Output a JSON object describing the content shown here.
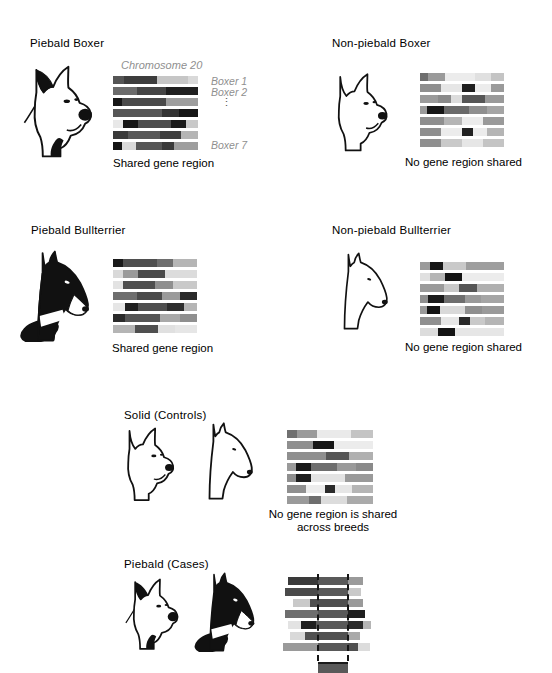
{
  "colors": {
    "background": "#ffffff",
    "text": "#000000",
    "muted_label": "#8f8f8f",
    "dashed_line": "#151515",
    "shared_segment": "#595959"
  },
  "panels": [
    {
      "id": "piebald-boxer",
      "title": "Piebald Boxer",
      "caption": "Shared gene region",
      "labels": {
        "chromosome": "Chromosome 20",
        "row_first": "Boxer 1",
        "row_second": "Boxer 2",
        "ellipsis": "⋮",
        "row_last": "Boxer 7"
      },
      "dog": "piebald-boxer-head",
      "bars": [
        [
          {
            "c": "#555555",
            "w": 13
          },
          {
            "c": "#3d3d3d",
            "w": 39
          },
          {
            "c": "#c6c6c6",
            "w": 36
          },
          {
            "c": "#d9d9d9",
            "w": 12
          }
        ],
        [
          {
            "c": "#6b6b6b",
            "w": 28
          },
          {
            "c": "#454545",
            "w": 34
          },
          {
            "c": "#1f1f1f",
            "w": 38
          }
        ],
        [
          {
            "c": "#161616",
            "w": 10
          },
          {
            "c": "#4a4a4a",
            "w": 52
          },
          {
            "c": "#9e9e9e",
            "w": 38
          }
        ],
        [
          {
            "c": "#575757",
            "w": 58
          },
          {
            "c": "#333333",
            "w": 20
          },
          {
            "c": "#161616",
            "w": 22
          }
        ],
        [
          {
            "c": "#e8e8e8",
            "w": 12
          },
          {
            "c": "#161616",
            "w": 18
          },
          {
            "c": "#4d4d4d",
            "w": 38
          },
          {
            "c": "#1a1a1a",
            "w": 18
          },
          {
            "c": "#c9c9c9",
            "w": 14
          }
        ],
        [
          {
            "c": "#3a3a3a",
            "w": 18
          },
          {
            "c": "#585858",
            "w": 37
          },
          {
            "c": "#3f3f3f",
            "w": 25
          },
          {
            "c": "#b5b5b5",
            "w": 20
          }
        ],
        [
          {
            "c": "#141414",
            "w": 10
          },
          {
            "c": "#d9d9d9",
            "w": 17
          },
          {
            "c": "#565656",
            "w": 31
          },
          {
            "c": "#3a3a3a",
            "w": 14
          },
          {
            "c": "#9e9e9e",
            "w": 28
          }
        ]
      ]
    },
    {
      "id": "non-piebald-boxer",
      "title": "Non-piebald Boxer",
      "caption": "No gene region shared",
      "dog": "solid-boxer-head",
      "bars": [
        [
          {
            "c": "#6e6e6e",
            "w": 10
          },
          {
            "c": "#9a9a9a",
            "w": 20
          },
          {
            "c": "#ececec",
            "w": 35
          },
          {
            "c": "#e0e0e0",
            "w": 20
          },
          {
            "c": "#c4c4c4",
            "w": 15
          }
        ],
        [
          {
            "c": "#8f8f8f",
            "w": 25
          },
          {
            "c": "#e6e6e6",
            "w": 25
          },
          {
            "c": "#1f1f1f",
            "w": 15
          },
          {
            "c": "#ececec",
            "w": 20
          },
          {
            "c": "#9a9a9a",
            "w": 15
          }
        ],
        [
          {
            "c": "#9a9a9a",
            "w": 22
          },
          {
            "c": "#8a8a8a",
            "w": 15
          },
          {
            "c": "#dcdcdc",
            "w": 13
          },
          {
            "c": "#565656",
            "w": 28
          },
          {
            "c": "#9a9a9a",
            "w": 22
          }
        ],
        [
          {
            "c": "#9a9a9a",
            "w": 8
          },
          {
            "c": "#161616",
            "w": 20
          },
          {
            "c": "#6a6a6a",
            "w": 30
          },
          {
            "c": "#8f8f8f",
            "w": 22
          },
          {
            "c": "#a5a5a5",
            "w": 20
          }
        ],
        [
          {
            "c": "#8f8f8f",
            "w": 28
          },
          {
            "c": "#b5b5b5",
            "w": 22
          },
          {
            "c": "#ececec",
            "w": 25
          },
          {
            "c": "#9a9a9a",
            "w": 25
          }
        ],
        [
          {
            "c": "#8f8f8f",
            "w": 25
          },
          {
            "c": "#ececec",
            "w": 25
          },
          {
            "c": "#222222",
            "w": 13
          },
          {
            "c": "#ececec",
            "w": 17
          },
          {
            "c": "#b5b5b5",
            "w": 20
          }
        ],
        [
          {
            "c": "#8f8f8f",
            "w": 25
          },
          {
            "c": "#c9c9c9",
            "w": 25
          },
          {
            "c": "#e6e6e6",
            "w": 25
          },
          {
            "c": "#c4c4c4",
            "w": 25
          }
        ]
      ]
    },
    {
      "id": "piebald-bullterrier",
      "title": "Piebald Bullterrier",
      "caption": "Shared gene region",
      "dog": "piebald-bullterrier-head",
      "bars": [
        [
          {
            "c": "#1a1a1a",
            "w": 12
          },
          {
            "c": "#4f4f4f",
            "w": 40
          },
          {
            "c": "#6e6e6e",
            "w": 20
          },
          {
            "c": "#b5b5b5",
            "w": 28
          }
        ],
        [
          {
            "c": "#d9d9d9",
            "w": 12
          },
          {
            "c": "#9a9a9a",
            "w": 18
          },
          {
            "c": "#4a4a4a",
            "w": 32
          },
          {
            "c": "#dcdcdc",
            "w": 38
          }
        ],
        [
          {
            "c": "#e3e3e3",
            "w": 12
          },
          {
            "c": "#4f4f4f",
            "w": 38
          },
          {
            "c": "#8f8f8f",
            "w": 22
          },
          {
            "c": "#c9c9c9",
            "w": 28
          }
        ],
        [
          {
            "c": "#6e6e6e",
            "w": 28
          },
          {
            "c": "#4a4a4a",
            "w": 30
          },
          {
            "c": "#9a9a9a",
            "w": 22
          },
          {
            "c": "#2a2a2a",
            "w": 20
          }
        ],
        [
          {
            "c": "#e6e6e6",
            "w": 14
          },
          {
            "c": "#1f1f1f",
            "w": 16
          },
          {
            "c": "#4f4f4f",
            "w": 34
          },
          {
            "c": "#2e2e2e",
            "w": 20
          },
          {
            "c": "#b5b5b5",
            "w": 16
          }
        ],
        [
          {
            "c": "#2a2a2a",
            "w": 14
          },
          {
            "c": "#555555",
            "w": 42
          },
          {
            "c": "#a9a9a9",
            "w": 24
          },
          {
            "c": "#8f8f8f",
            "w": 20
          }
        ],
        [
          {
            "c": "#b5b5b5",
            "w": 26
          },
          {
            "c": "#4f4f4f",
            "w": 28
          },
          {
            "c": "#e0e0e0",
            "w": 20
          },
          {
            "c": "#e6e6e6",
            "w": 26
          }
        ]
      ]
    },
    {
      "id": "non-piebald-bullterrier",
      "title": "Non-piebald Bullterrier",
      "caption": "No gene region shared",
      "dog": "solid-bullterrier-head",
      "bars": [
        [
          {
            "c": "#9a9a9a",
            "w": 12
          },
          {
            "c": "#161616",
            "w": 15
          },
          {
            "c": "#c9c9c9",
            "w": 28
          },
          {
            "c": "#9e9e9e",
            "w": 45
          }
        ],
        [
          {
            "c": "#e0e0e0",
            "w": 12
          },
          {
            "c": "#b5b5b5",
            "w": 18
          },
          {
            "c": "#141414",
            "w": 20
          },
          {
            "c": "#ececec",
            "w": 50
          }
        ],
        [
          {
            "c": "#9a9a9a",
            "w": 28
          },
          {
            "c": "#c9c9c9",
            "w": 18
          },
          {
            "c": "#565656",
            "w": 22
          },
          {
            "c": "#b0b0b0",
            "w": 32
          }
        ],
        [
          {
            "c": "#8f8f8f",
            "w": 10
          },
          {
            "c": "#1a1a1a",
            "w": 18
          },
          {
            "c": "#6e6e6e",
            "w": 25
          },
          {
            "c": "#9a9a9a",
            "w": 20
          },
          {
            "c": "#a5a5a5",
            "w": 27
          }
        ],
        [
          {
            "c": "#9a9a9a",
            "w": 8
          },
          {
            "c": "#141414",
            "w": 16
          },
          {
            "c": "#d9d9d9",
            "w": 30
          },
          {
            "c": "#8f8f8f",
            "w": 20
          },
          {
            "c": "#9a9a9a",
            "w": 26
          }
        ],
        [
          {
            "c": "#8f8f8f",
            "w": 25
          },
          {
            "c": "#e6e6e6",
            "w": 22
          },
          {
            "c": "#2a2a2a",
            "w": 13
          },
          {
            "c": "#c9c9c9",
            "w": 18
          },
          {
            "c": "#b5b5b5",
            "w": 22
          }
        ],
        [
          {
            "c": "#dcdcdc",
            "w": 22
          },
          {
            "c": "#141414",
            "w": 20
          },
          {
            "c": "#e6e6e6",
            "w": 58
          }
        ]
      ]
    },
    {
      "id": "solid-controls",
      "title": "Solid (Controls)",
      "caption_line1": "No gene region is shared",
      "caption_line2": "across breeds",
      "dogs": [
        "solid-boxer-head",
        "solid-bullterrier-head"
      ],
      "bars": [
        [
          {
            "c": "#707070",
            "w": 12
          },
          {
            "c": "#9a9a9a",
            "w": 23
          },
          {
            "c": "#eaeaea",
            "w": 40
          },
          {
            "c": "#c4c4c4",
            "w": 25
          }
        ],
        [
          {
            "c": "#8f8f8f",
            "w": 30
          },
          {
            "c": "#161616",
            "w": 25
          },
          {
            "c": "#ececec",
            "w": 45
          }
        ],
        [
          {
            "c": "#8f8f8f",
            "w": 45
          },
          {
            "c": "#565656",
            "w": 27
          },
          {
            "c": "#b0b0b0",
            "w": 28
          }
        ],
        [
          {
            "c": "#9a9a9a",
            "w": 10
          },
          {
            "c": "#1a1a1a",
            "w": 18
          },
          {
            "c": "#6e6e6e",
            "w": 30
          },
          {
            "c": "#9a9a9a",
            "w": 22
          },
          {
            "c": "#8a8a8a",
            "w": 20
          }
        ],
        [
          {
            "c": "#8f8f8f",
            "w": 10
          },
          {
            "c": "#1f1f1f",
            "w": 18
          },
          {
            "c": "#e3e3e3",
            "w": 40
          },
          {
            "c": "#9a9a9a",
            "w": 32
          }
        ],
        [
          {
            "c": "#8f8f8f",
            "w": 22
          },
          {
            "c": "#ececec",
            "w": 22
          },
          {
            "c": "#2a2a2a",
            "w": 12
          },
          {
            "c": "#e6e6e6",
            "w": 20
          },
          {
            "c": "#b5b5b5",
            "w": 24
          }
        ],
        [
          {
            "c": "#9a9a9a",
            "w": 25
          },
          {
            "c": "#6e6e6e",
            "w": 15
          },
          {
            "c": "#dcdcdc",
            "w": 30
          },
          {
            "c": "#aaaaaa",
            "w": 30
          }
        ]
      ]
    },
    {
      "id": "piebald-cases",
      "title": "Piebald (Cases)",
      "dogs": [
        "piebald-boxer-head",
        "piebald-bullterrier-head"
      ],
      "staggered_bars": [
        {
          "off": 5,
          "segs": [
            {
              "c": "#3a3a3a",
              "w": 30
            },
            {
              "c": "#595959",
              "w": 30
            },
            {
              "c": "#9a9a9a",
              "w": 15
            }
          ]
        },
        {
          "off": 2,
          "segs": [
            {
              "c": "#4a4a4a",
              "w": 33
            },
            {
              "c": "#595959",
              "w": 30
            },
            {
              "c": "#c9c9c9",
              "w": 13
            }
          ]
        },
        {
          "off": 10,
          "segs": [
            {
              "c": "#c9c9c9",
              "w": 17
            },
            {
              "c": "#4f4f4f",
              "w": 38
            },
            {
              "c": "#9a9a9a",
              "w": 15
            }
          ]
        },
        {
          "off": 2,
          "segs": [
            {
              "c": "#6e6e6e",
              "w": 33
            },
            {
              "c": "#595959",
              "w": 30
            },
            {
              "c": "#1f1f1f",
              "w": 17
            }
          ]
        },
        {
          "off": 5,
          "segs": [
            {
              "c": "#e3e3e3",
              "w": 13
            },
            {
              "c": "#1f1f1f",
              "w": 15
            },
            {
              "c": "#595959",
              "w": 32
            },
            {
              "c": "#2a2a2a",
              "w": 15
            },
            {
              "c": "#b5b5b5",
              "w": 8
            }
          ]
        },
        {
          "off": 7,
          "segs": [
            {
              "c": "#d9d9d9",
              "w": 15
            },
            {
              "c": "#515151",
              "w": 43
            },
            {
              "c": "#a9a9a9",
              "w": 12
            }
          ]
        },
        {
          "off": 0,
          "segs": [
            {
              "c": "#9a9a9a",
              "w": 35
            },
            {
              "c": "#595959",
              "w": 30
            },
            {
              "c": "#4f4f4f",
              "w": 10
            },
            {
              "c": "#dcdcdc",
              "w": 12
            }
          ]
        }
      ],
      "shared_region": {
        "color": "#595959"
      }
    }
  ]
}
